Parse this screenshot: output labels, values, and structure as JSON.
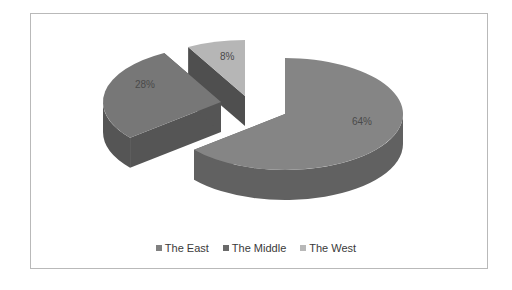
{
  "chart_data": {
    "type": "pie",
    "style": "3d-exploded",
    "title": "",
    "categories": [
      "The East",
      "The Middle",
      "The West"
    ],
    "values": [
      64,
      28,
      8
    ],
    "labels": [
      "64%",
      "28%",
      "8%"
    ],
    "colors": {
      "The East": "#7f7f7f",
      "The Middle": "#6e6e6e",
      "The West": "#b5b5b5"
    },
    "legend_position": "bottom"
  },
  "legend": {
    "items": [
      {
        "label": "The East",
        "color": "#808080"
      },
      {
        "label": "The Middle",
        "color": "#6a6a6a"
      },
      {
        "label": "The West",
        "color": "#b8b8b8"
      }
    ]
  }
}
